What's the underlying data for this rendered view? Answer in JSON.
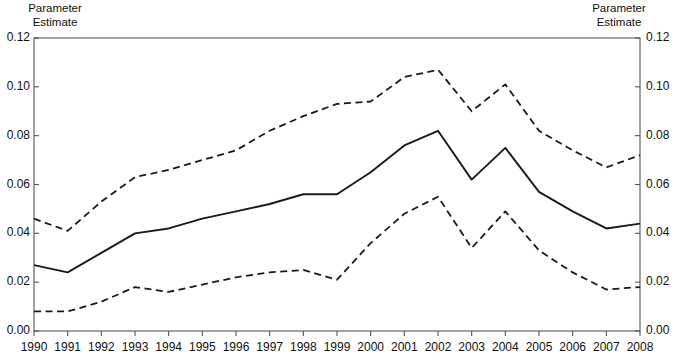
{
  "figure": {
    "axis_title_left": "Parameter\nEstimate",
    "axis_title_right": "Parameter\nEstimate",
    "line_color": "#1a1a1a",
    "frame_color": "#555555",
    "background": "#ffffff"
  },
  "chart_data": {
    "type": "line",
    "title": "",
    "subtitle": "",
    "xlabel": "",
    "ylabel": "Parameter Estimate",
    "y2label": "Parameter Estimate",
    "grid": false,
    "legend": false,
    "legend_position": "none",
    "xlim": [
      1990,
      2008
    ],
    "ylim": [
      0.0,
      0.12
    ],
    "categories": [
      1990,
      1991,
      1992,
      1993,
      1994,
      1995,
      1996,
      1997,
      1998,
      1999,
      2000,
      2001,
      2002,
      2003,
      2004,
      2005,
      2006,
      2007,
      2008
    ],
    "x": [
      1990,
      1991,
      1992,
      1993,
      1994,
      1995,
      1996,
      1997,
      1998,
      1999,
      2000,
      2001,
      2002,
      2003,
      2004,
      2005,
      2006,
      2007,
      2008
    ],
    "xticks": [
      "1990",
      "1991",
      "1992",
      "1993",
      "1994",
      "1995",
      "1996",
      "1997",
      "1998",
      "1999",
      "2000",
      "2001",
      "2002",
      "2003",
      "2004",
      "2005",
      "2006",
      "2007",
      "2008"
    ],
    "yticks": [
      "0.00",
      "0.02",
      "0.04",
      "0.06",
      "0.08",
      "0.10",
      "0.12"
    ],
    "ytick_values": [
      0.0,
      0.02,
      0.04,
      0.06,
      0.08,
      0.1,
      0.12
    ],
    "y2ticks": [
      "0.00",
      "0.02",
      "0.04",
      "0.06",
      "0.08",
      "0.10",
      "0.12"
    ],
    "series": [
      {
        "name": "Parameter Estimate",
        "style": "solid",
        "values": [
          0.027,
          0.024,
          0.032,
          0.04,
          0.042,
          0.046,
          0.049,
          0.052,
          0.056,
          0.056,
          0.065,
          0.076,
          0.082,
          0.062,
          0.075,
          0.057,
          0.049,
          0.042,
          0.044
        ]
      },
      {
        "name": "Upper Confidence Limit",
        "style": "dashed",
        "values": [
          0.046,
          0.041,
          0.053,
          0.063,
          0.066,
          0.07,
          0.074,
          0.082,
          0.088,
          0.093,
          0.094,
          0.104,
          0.107,
          0.09,
          0.101,
          0.082,
          0.074,
          0.067,
          0.072
        ]
      },
      {
        "name": "Lower Confidence Limit",
        "style": "dashed",
        "values": [
          0.008,
          0.008,
          0.012,
          0.018,
          0.016,
          0.019,
          0.022,
          0.024,
          0.025,
          0.021,
          0.036,
          0.048,
          0.055,
          0.034,
          0.049,
          0.033,
          0.024,
          0.017,
          0.018
        ]
      }
    ]
  }
}
